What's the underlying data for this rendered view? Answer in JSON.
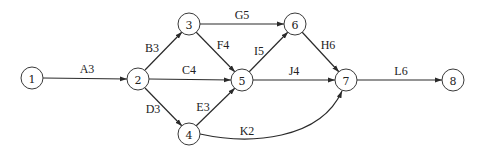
{
  "diagram": {
    "type": "activity-on-arrow network",
    "nodes": [
      {
        "id": "1",
        "label": "1",
        "x": 32,
        "y": 78
      },
      {
        "id": "2",
        "label": "2",
        "x": 138,
        "y": 79
      },
      {
        "id": "3",
        "label": "3",
        "x": 189,
        "y": 24
      },
      {
        "id": "4",
        "label": "4",
        "x": 189,
        "y": 134
      },
      {
        "id": "5",
        "label": "5",
        "x": 242,
        "y": 80
      },
      {
        "id": "6",
        "label": "6",
        "x": 295,
        "y": 24
      },
      {
        "id": "7",
        "label": "7",
        "x": 346,
        "y": 80
      },
      {
        "id": "8",
        "label": "8",
        "x": 453,
        "y": 80
      }
    ],
    "edges": [
      {
        "from": "1",
        "to": "2",
        "label": "A3",
        "activity": "A",
        "duration": 3
      },
      {
        "from": "2",
        "to": "3",
        "label": "B3",
        "activity": "B",
        "duration": 3
      },
      {
        "from": "2",
        "to": "5",
        "label": "C4",
        "activity": "C",
        "duration": 4
      },
      {
        "from": "2",
        "to": "4",
        "label": "D3",
        "activity": "D",
        "duration": 3
      },
      {
        "from": "4",
        "to": "5",
        "label": "E3",
        "activity": "E",
        "duration": 3
      },
      {
        "from": "3",
        "to": "5",
        "label": "F4",
        "activity": "F",
        "duration": 4
      },
      {
        "from": "3",
        "to": "6",
        "label": "G5",
        "activity": "G",
        "duration": 5
      },
      {
        "from": "6",
        "to": "7",
        "label": "H6",
        "activity": "H",
        "duration": 6
      },
      {
        "from": "5",
        "to": "6",
        "label": "I5",
        "activity": "I",
        "duration": 5
      },
      {
        "from": "5",
        "to": "7",
        "label": "J4",
        "activity": "J",
        "duration": 4
      },
      {
        "from": "4",
        "to": "7",
        "label": "K2",
        "activity": "K",
        "duration": 2,
        "curved": true
      },
      {
        "from": "7",
        "to": "8",
        "label": "L6",
        "activity": "L",
        "duration": 6
      }
    ]
  }
}
